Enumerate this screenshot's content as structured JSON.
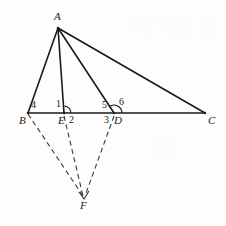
{
  "figure": {
    "canvas": {
      "width": 226,
      "height": 226
    },
    "background_color": "#fdfdfd",
    "stroke_color": "#1a1a1a",
    "dashed_stroke_color": "#3a3a3a",
    "points": {
      "A": {
        "x": 58,
        "y": 28,
        "label": "A",
        "label_x": 54,
        "label_y": 11
      },
      "B": {
        "x": 28,
        "y": 113,
        "label": "B",
        "label_x": 19,
        "label_y": 115
      },
      "E": {
        "x": 64,
        "y": 113,
        "label": "E",
        "label_x": 58,
        "label_y": 115
      },
      "D": {
        "x": 114,
        "y": 113,
        "label": "D",
        "label_x": 114,
        "label_y": 115
      },
      "C": {
        "x": 205,
        "y": 113,
        "label": "C",
        "label_x": 208,
        "label_y": 115
      },
      "F": {
        "x": 84,
        "y": 198,
        "label": "F",
        "label_x": 80,
        "label_y": 200
      }
    },
    "solid_segments": [
      {
        "name": "segment-AB",
        "from": "A",
        "to": "B"
      },
      {
        "name": "segment-AE",
        "from": "A",
        "to": "E"
      },
      {
        "name": "segment-AD",
        "from": "A",
        "to": "D"
      },
      {
        "name": "segment-AC",
        "from": "A",
        "to": "C"
      },
      {
        "name": "segment-BC",
        "from": "B",
        "to": "C"
      }
    ],
    "dashed_segments": [
      {
        "name": "segment-BF",
        "from": "B",
        "to": "F"
      },
      {
        "name": "segment-EF",
        "from": "E",
        "to": "F"
      },
      {
        "name": "segment-DF",
        "from": "D",
        "to": "F"
      }
    ],
    "angle_marks": [
      {
        "name": "angle-arc-at-E",
        "cx": 64,
        "cy": 113,
        "r": 7
      },
      {
        "name": "angle-arc-at-D",
        "cx": 114,
        "cy": 113,
        "r": 8
      }
    ],
    "angle_labels": [
      {
        "id": "1",
        "text": "1",
        "x": 56,
        "y": 99
      },
      {
        "id": "2",
        "text": "2",
        "x": 69,
        "y": 115
      },
      {
        "id": "3",
        "text": "3",
        "x": 104,
        "y": 115
      },
      {
        "id": "4",
        "text": "4",
        "x": 31,
        "y": 100
      },
      {
        "id": "5",
        "text": "5",
        "x": 102,
        "y": 100
      },
      {
        "id": "6",
        "text": "6",
        "x": 119,
        "y": 97
      }
    ]
  },
  "watermarks": [
    {
      "text": "教师",
      "x": 128,
      "y": 4,
      "size": 28
    },
    {
      "text": "资源",
      "x": 170,
      "y": 8,
      "size": 24
    },
    {
      "text": "网",
      "x": 150,
      "y": 128,
      "size": 26
    }
  ]
}
